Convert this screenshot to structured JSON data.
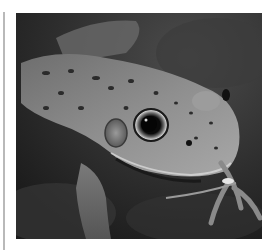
{
  "image": {
    "subject": "frog",
    "alt": "Close-up photograph of a spotted frog resting on dark rocks",
    "colors": {
      "background": "#ffffff",
      "side_line": "#b9b9b9",
      "rock_dark": "#262626",
      "rock_mid": "#4a4a4a",
      "skin_light": "#9a9a9a",
      "skin_mid": "#7a7a7a",
      "spots": "#2b2b2b",
      "eye": "#0c0c0c"
    }
  }
}
